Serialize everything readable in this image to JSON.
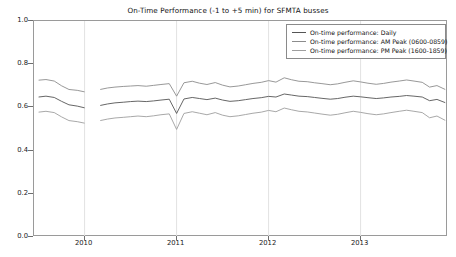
{
  "chart_data": {
    "type": "line",
    "title": "On-Time Performance (-1 to +5 min) for SFMTA busses",
    "xlabel": "",
    "ylabel": "",
    "ylim": [
      0.0,
      1.0
    ],
    "xlim": [
      2009.45,
      2013.95
    ],
    "yticks": [
      "0.0",
      "0.2",
      "0.4",
      "0.6",
      "0.8",
      "1.0"
    ],
    "ytick_values": [
      0.0,
      0.2,
      0.4,
      0.6,
      0.8,
      1.0
    ],
    "xticks": [
      "2010",
      "2011",
      "2012",
      "2013"
    ],
    "xtick_values": [
      2010,
      2011,
      2012,
      2013
    ],
    "grid": true,
    "grid_axis": "x",
    "legend_position": "upper right",
    "colors": {
      "daily": "#555555",
      "am_peak": "#8c8c8c",
      "pm_peak": "#9e9e9e",
      "axis": "#9a9a9a",
      "grid": "#e2e2e2",
      "text": "#111111"
    },
    "series": [
      {
        "name": "On-time performance: Daily",
        "color": "#555555",
        "x": [
          2009.5,
          2009.58,
          2009.67,
          2009.75,
          2009.83,
          2009.92,
          2010.0,
          2010.08,
          2010.17,
          2010.25,
          2010.33,
          2010.42,
          2010.5,
          2010.58,
          2010.67,
          2010.75,
          2010.83,
          2010.92,
          2011.0,
          2011.08,
          2011.17,
          2011.25,
          2011.33,
          2011.42,
          2011.5,
          2011.58,
          2011.67,
          2011.75,
          2011.83,
          2011.92,
          2012.0,
          2012.08,
          2012.17,
          2012.25,
          2012.33,
          2012.42,
          2012.5,
          2012.58,
          2012.67,
          2012.75,
          2012.83,
          2012.92,
          2013.0,
          2013.08,
          2013.17,
          2013.25,
          2013.33,
          2013.42,
          2013.5,
          2013.58,
          2013.67,
          2013.75,
          2013.83,
          2013.92
        ],
        "y": [
          0.648,
          0.652,
          0.646,
          0.628,
          0.612,
          0.606,
          0.598,
          0.601,
          0.609,
          0.616,
          0.621,
          0.624,
          0.627,
          0.629,
          0.627,
          0.63,
          0.634,
          0.638,
          0.572,
          0.639,
          0.646,
          0.641,
          0.636,
          0.643,
          0.634,
          0.628,
          0.631,
          0.636,
          0.641,
          0.645,
          0.651,
          0.648,
          0.662,
          0.657,
          0.652,
          0.65,
          0.646,
          0.642,
          0.638,
          0.641,
          0.647,
          0.652,
          0.649,
          0.645,
          0.641,
          0.644,
          0.648,
          0.651,
          0.655,
          0.652,
          0.648,
          0.631,
          0.637,
          0.622
        ]
      },
      {
        "name": "On-time performance: AM Peak (0600-0859)",
        "color": "#8c8c8c",
        "x": [
          2009.5,
          2009.58,
          2009.67,
          2009.75,
          2009.83,
          2009.92,
          2010.0,
          2010.08,
          2010.17,
          2010.25,
          2010.33,
          2010.42,
          2010.5,
          2010.58,
          2010.67,
          2010.75,
          2010.83,
          2010.92,
          2011.0,
          2011.08,
          2011.17,
          2011.25,
          2011.33,
          2011.42,
          2011.5,
          2011.58,
          2011.67,
          2011.75,
          2011.83,
          2011.92,
          2012.0,
          2012.08,
          2012.17,
          2012.25,
          2012.33,
          2012.42,
          2012.5,
          2012.58,
          2012.67,
          2012.75,
          2012.83,
          2012.92,
          2013.0,
          2013.08,
          2013.17,
          2013.25,
          2013.33,
          2013.42,
          2013.5,
          2013.58,
          2013.67,
          2013.75,
          2013.83,
          2013.92
        ],
        "y": [
          0.726,
          0.729,
          0.722,
          0.7,
          0.683,
          0.679,
          0.672,
          0.676,
          0.683,
          0.69,
          0.694,
          0.697,
          0.699,
          0.701,
          0.698,
          0.702,
          0.706,
          0.71,
          0.652,
          0.714,
          0.721,
          0.712,
          0.706,
          0.715,
          0.703,
          0.695,
          0.699,
          0.705,
          0.711,
          0.716,
          0.724,
          0.717,
          0.737,
          0.728,
          0.721,
          0.719,
          0.714,
          0.71,
          0.705,
          0.709,
          0.716,
          0.723,
          0.718,
          0.712,
          0.707,
          0.711,
          0.717,
          0.722,
          0.727,
          0.722,
          0.716,
          0.694,
          0.701,
          0.683
        ]
      },
      {
        "name": "On-time performance: PM Peak (1600-1859)",
        "color": "#9e9e9e",
        "x": [
          2009.5,
          2009.58,
          2009.67,
          2009.75,
          2009.83,
          2009.92,
          2010.0,
          2010.08,
          2010.17,
          2010.25,
          2010.33,
          2010.42,
          2010.5,
          2010.58,
          2010.67,
          2010.75,
          2010.83,
          2010.92,
          2011.0,
          2011.08,
          2011.17,
          2011.25,
          2011.33,
          2011.42,
          2011.5,
          2011.58,
          2011.67,
          2011.75,
          2011.83,
          2011.92,
          2012.0,
          2012.08,
          2012.17,
          2012.25,
          2012.33,
          2012.42,
          2012.5,
          2012.58,
          2012.67,
          2012.75,
          2012.83,
          2012.92,
          2013.0,
          2013.08,
          2013.17,
          2013.25,
          2013.33,
          2013.42,
          2013.5,
          2013.58,
          2013.67,
          2013.75,
          2013.83,
          2013.92
        ],
        "y": [
          0.578,
          0.582,
          0.576,
          0.556,
          0.539,
          0.534,
          0.527,
          0.531,
          0.539,
          0.546,
          0.551,
          0.554,
          0.557,
          0.56,
          0.557,
          0.561,
          0.566,
          0.57,
          0.498,
          0.572,
          0.58,
          0.573,
          0.566,
          0.576,
          0.564,
          0.557,
          0.561,
          0.567,
          0.573,
          0.578,
          0.586,
          0.58,
          0.597,
          0.589,
          0.582,
          0.579,
          0.574,
          0.569,
          0.564,
          0.568,
          0.575,
          0.582,
          0.577,
          0.571,
          0.566,
          0.57,
          0.576,
          0.582,
          0.587,
          0.582,
          0.576,
          0.552,
          0.56,
          0.54
        ]
      }
    ],
    "gap": {
      "note": "data gap in all series",
      "x_start": 2010.04,
      "x_end": 2010.16
    }
  },
  "legend": {
    "entries": [
      {
        "label": "On-time performance: Daily"
      },
      {
        "label": "On-time performance: AM Peak (0600-0859)"
      },
      {
        "label": "On-time performance: PM Peak (1600-1859)"
      }
    ]
  }
}
